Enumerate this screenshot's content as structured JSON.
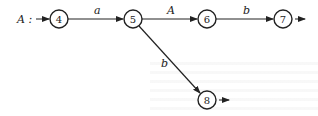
{
  "diagram": {
    "type": "state-transition-graph",
    "start_label": "A :",
    "nodes": [
      {
        "id": "4",
        "label": "4",
        "initial": true,
        "final": false
      },
      {
        "id": "5",
        "label": "5",
        "initial": false,
        "final": false
      },
      {
        "id": "6",
        "label": "6",
        "initial": false,
        "final": false
      },
      {
        "id": "7",
        "label": "7",
        "initial": false,
        "final": true
      },
      {
        "id": "8",
        "label": "8",
        "initial": false,
        "final": true
      }
    ],
    "edges": [
      {
        "from": "4",
        "to": "5",
        "label": "a"
      },
      {
        "from": "5",
        "to": "6",
        "label": "A"
      },
      {
        "from": "6",
        "to": "7",
        "label": "b"
      },
      {
        "from": "5",
        "to": "8",
        "label": "b"
      }
    ],
    "colors": {
      "stroke": "#222222",
      "background": "#ffffff"
    }
  }
}
